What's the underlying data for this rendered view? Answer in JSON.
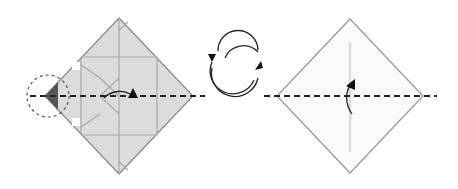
{
  "diagram": {
    "type": "origami-fold-instructions",
    "steps": [
      {
        "id": "step-left",
        "description": "Folded square base (gray), reference circle highlight on left point, valley fold along horizontal diagonal",
        "fill": "#dcdcdc",
        "stroke": "#8c8c8c",
        "highlight_fill": "#555555"
      },
      {
        "id": "turn-over-symbol",
        "description": "Turn model over (two circular arrows)"
      },
      {
        "id": "step-right",
        "description": "Unfolded white square with vertical crease, valley fold along horizontal diagonal",
        "fill": "#fafafa",
        "stroke": "#9a9a9a"
      }
    ],
    "colors": {
      "line": "#222222",
      "paper_gray": "#dcdcdc",
      "crease": "#a8a8a8",
      "dark_flap": "#555555"
    }
  }
}
